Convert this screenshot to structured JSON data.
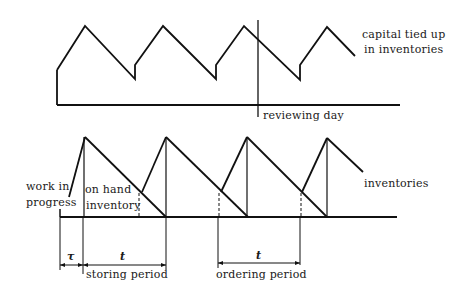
{
  "diagram": {
    "upper": {
      "label_line1": "capital tied up",
      "label_line2": "in inventories",
      "marker_label": "reviewing day"
    },
    "lower": {
      "left_label_line1": "work in",
      "left_label_line2": "progress",
      "onhand_label_line1": "on hand",
      "onhand_label_line2": "inventory",
      "right_label": "inventories",
      "dim_tau": "τ",
      "dim_t1": "t",
      "dim_t2": "t",
      "storing_label": "storing period",
      "ordering_label": "ordering period"
    },
    "colors": {
      "line": "#111111",
      "background": "#ffffff"
    }
  }
}
